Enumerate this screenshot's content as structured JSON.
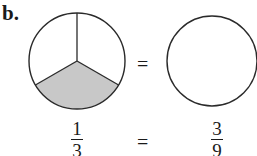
{
  "figure": {
    "label": "b.",
    "equals_symbol": "=",
    "left_circle": {
      "parts": 3,
      "shaded_parts": 1,
      "shade_color": "#c8c8c8",
      "stroke_color": "#2a2a2a"
    },
    "right_circle": {
      "parts": 0,
      "shaded_parts": 0,
      "stroke_color": "#2a2a2a"
    },
    "left_fraction": {
      "numerator": "1",
      "denominator": "3"
    },
    "right_fraction": {
      "numerator": "3",
      "denominator": "9"
    }
  }
}
